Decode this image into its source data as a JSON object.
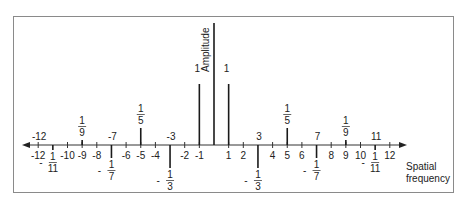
{
  "figure": {
    "y_axis_label": "Amplitude",
    "x_axis_label_line1": "Spatial",
    "x_axis_label_line2": "frequency",
    "colors": {
      "frame": "#8a8a8a",
      "ink": "#1a1a1a"
    }
  },
  "axis": {
    "origin_x": 214,
    "axis_y": 145,
    "unit_px": 14.65,
    "ticks": [
      {
        "v": -12,
        "label": "-12"
      },
      {
        "v": -10,
        "label": "-10"
      },
      {
        "v": -9,
        "label": "-9"
      },
      {
        "v": -8,
        "label": "-8"
      },
      {
        "v": -6,
        "label": "-6"
      },
      {
        "v": -5,
        "label": "-5"
      },
      {
        "v": -4,
        "label": "-4"
      },
      {
        "v": -2,
        "label": "-2"
      },
      {
        "v": -1,
        "label": "-1"
      },
      {
        "v": 1,
        "label": "1"
      },
      {
        "v": 2,
        "label": "2"
      },
      {
        "v": 4,
        "label": "4"
      },
      {
        "v": 5,
        "label": "5"
      },
      {
        "v": 6,
        "label": "6"
      },
      {
        "v": 8,
        "label": "8"
      },
      {
        "v": 9,
        "label": "9"
      },
      {
        "v": 10,
        "label": "10"
      },
      {
        "v": 12,
        "label": "12"
      }
    ],
    "upper_index_labels": [
      {
        "v": -12,
        "label": "-12"
      },
      {
        "v": -7,
        "label": "-7"
      },
      {
        "v": -3,
        "label": "-3"
      },
      {
        "v": 3,
        "label": "3"
      },
      {
        "v": 7,
        "label": "7"
      },
      {
        "v": 11,
        "label": "11"
      }
    ]
  },
  "spikes": [
    {
      "v": 0,
      "top": 23,
      "bottom": 145,
      "label": ""
    },
    {
      "v": -1,
      "top": 84,
      "bottom": 145,
      "label": "1"
    },
    {
      "v": 1,
      "top": 84,
      "bottom": 145,
      "label": "1"
    },
    {
      "v": -3,
      "top": 145,
      "bottom": 168,
      "num": "1",
      "den": "3",
      "sign": "-"
    },
    {
      "v": 3,
      "top": 145,
      "bottom": 168,
      "num": "1",
      "den": "3",
      "sign": "-"
    },
    {
      "v": -5,
      "top": 128,
      "bottom": 145,
      "num": "1",
      "den": "5",
      "sign": ""
    },
    {
      "v": 5,
      "top": 128,
      "bottom": 145,
      "num": "1",
      "den": "5",
      "sign": ""
    },
    {
      "v": -7,
      "top": 145,
      "bottom": 158,
      "num": "1",
      "den": "7",
      "sign": "-"
    },
    {
      "v": 7,
      "top": 145,
      "bottom": 158,
      "num": "1",
      "den": "7",
      "sign": "-"
    },
    {
      "v": -9,
      "top": 140,
      "bottom": 145,
      "num": "1",
      "den": "9",
      "sign": ""
    },
    {
      "v": 9,
      "top": 140,
      "bottom": 145,
      "num": "1",
      "den": "9",
      "sign": ""
    },
    {
      "v": -11,
      "top": 145,
      "bottom": 150,
      "num": "1",
      "den": "11",
      "sign": "-"
    },
    {
      "v": 11,
      "top": 145,
      "bottom": 150,
      "num": "1",
      "den": "11",
      "sign": "-"
    }
  ]
}
